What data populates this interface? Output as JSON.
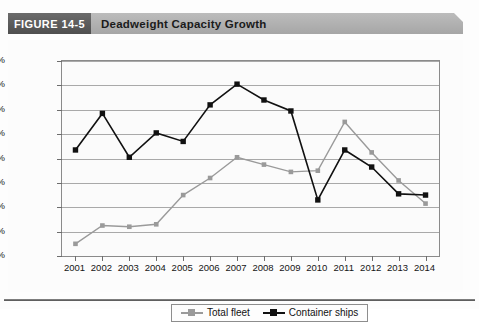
{
  "figure": {
    "number_label": "FIGURE 14-5",
    "title": "Deadweight Capacity Growth"
  },
  "colors": {
    "header_band": "#b0b0b0",
    "number_block": "#5a5a5a",
    "total_fleet": "#9a9a9a",
    "container_ships": "#111111",
    "gridline": "#a9a9a9",
    "plot_border": "#8a8a8a"
  },
  "chart_data": {
    "type": "line",
    "title": "Deadweight Capacity Growth",
    "xlabel": "",
    "ylabel": "",
    "ylim": [
      0,
      16
    ],
    "ytick_labels": [
      "0%",
      "2%",
      "4%",
      "6%",
      "8%",
      "10%",
      "12%",
      "14%",
      "16%"
    ],
    "ytick_values": [
      0,
      2,
      4,
      6,
      8,
      10,
      12,
      14,
      16
    ],
    "grid": true,
    "legend_position": "bottom-center",
    "categories": [
      "2001",
      "2002",
      "2003",
      "2004",
      "2005",
      "2006",
      "2007",
      "2008",
      "2009",
      "2010",
      "2011",
      "2012",
      "2013",
      "2014"
    ],
    "series": [
      {
        "name": "Total fleet",
        "color": "#9a9a9a",
        "marker": "square",
        "values": [
          1.0,
          2.5,
          2.4,
          2.6,
          5.0,
          6.4,
          8.1,
          7.5,
          6.9,
          7.0,
          11.0,
          8.5,
          6.2,
          4.3
        ]
      },
      {
        "name": "Container ships",
        "color": "#111111",
        "marker": "square",
        "values": [
          8.7,
          11.7,
          8.1,
          10.1,
          9.4,
          12.4,
          14.1,
          12.8,
          11.9,
          4.6,
          8.7,
          7.3,
          5.1,
          5.0
        ]
      }
    ]
  }
}
